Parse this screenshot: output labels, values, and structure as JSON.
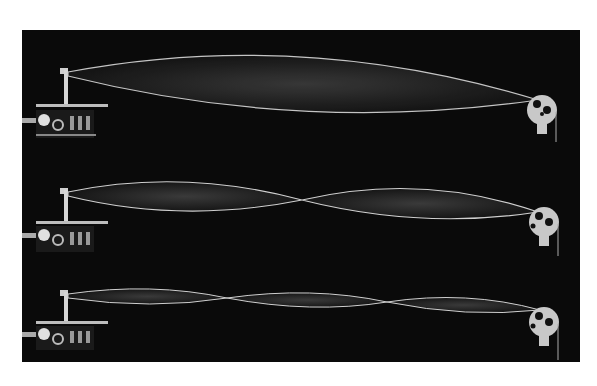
{
  "image": {
    "subject": "Standing waves on vibrating strings",
    "background_color": "#0a0a0a",
    "string_color": "#d8d8d8",
    "pulley_color": "#c8c8c8",
    "strings": [
      {
        "label": "first-harmonic",
        "loops": 1,
        "y": 48,
        "amplitude": 27
      },
      {
        "label": "second-harmonic",
        "loops": 2,
        "y": 168,
        "amplitude": 14
      },
      {
        "label": "third-harmonic",
        "loops": 3,
        "y": 268,
        "amplitude": 7
      }
    ]
  }
}
